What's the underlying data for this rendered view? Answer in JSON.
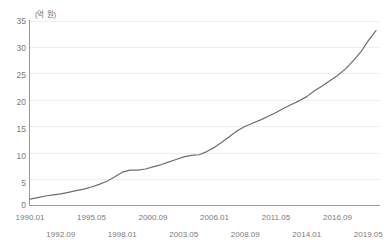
{
  "chart_data": {
    "type": "line",
    "title": "",
    "subtitle": "",
    "xlabel": "",
    "ylabel": "",
    "unit_label": "(억 원)",
    "ylim": [
      0,
      35
    ],
    "yticks": [
      35,
      30,
      25,
      20,
      15,
      10,
      5,
      0
    ],
    "grid": true,
    "grid_axis": "y",
    "legend": false,
    "legend_position": "none",
    "line_color": "#6e6e6e",
    "series": [
      {
        "name": "지수",
        "x": [
          "1990.01",
          "1990.09",
          "1991.05",
          "1992.01",
          "1992.09",
          "1993.05",
          "1994.01",
          "1994.09",
          "1995.05",
          "1996.01",
          "1996.09",
          "1997.05",
          "1998.01",
          "1998.09",
          "1999.05",
          "2000.01",
          "2000.09",
          "2001.05",
          "2002.01",
          "2002.09",
          "2003.05",
          "2004.01",
          "2004.09",
          "2005.05",
          "2006.01",
          "2006.09",
          "2007.05",
          "2008.01",
          "2008.09",
          "2009.05",
          "2010.01",
          "2010.09",
          "2011.05",
          "2012.01",
          "2012.09",
          "2013.05",
          "2014.01",
          "2014.09",
          "2015.05",
          "2016.01",
          "2016.09",
          "2017.05",
          "2018.01",
          "2018.09",
          "2019.05",
          "2019.12"
        ],
        "values": [
          1.2,
          1.5,
          1.8,
          2.0,
          2.2,
          2.5,
          2.8,
          3.1,
          3.5,
          4.0,
          4.6,
          5.4,
          6.3,
          6.7,
          6.7,
          6.9,
          7.3,
          7.7,
          8.2,
          8.7,
          9.2,
          9.5,
          9.6,
          10.2,
          11.0,
          12.0,
          13.1,
          14.2,
          15.0,
          15.6,
          16.2,
          16.9,
          17.6,
          18.4,
          19.1,
          19.8,
          20.6,
          21.7,
          22.6,
          23.6,
          24.6,
          25.8,
          27.3,
          29.0,
          31.2,
          33.1
        ]
      }
    ],
    "xtick_labels_row_a": [
      "1990.01",
      "1995.05",
      "2000.09",
      "2006.01",
      "2011.05",
      "2016.09"
    ],
    "xtick_labels_row_b": [
      "1992.09",
      "1998.01",
      "2003.05",
      "2008.09",
      "2014.01",
      "2019.05"
    ],
    "xtick_labels_all": [
      "1990.01",
      "1992.09",
      "1995.05",
      "1998.01",
      "2000.09",
      "2003.05",
      "2006.01",
      "2008.09",
      "2011.05",
      "2014.01",
      "2016.09",
      "2019.05"
    ]
  },
  "colors": {
    "line": "#6e6e6e",
    "grid": "#eeeeee",
    "axis": "#9a9a9a",
    "tick_text": "#7a7a7a",
    "background": "#ffffff"
  }
}
